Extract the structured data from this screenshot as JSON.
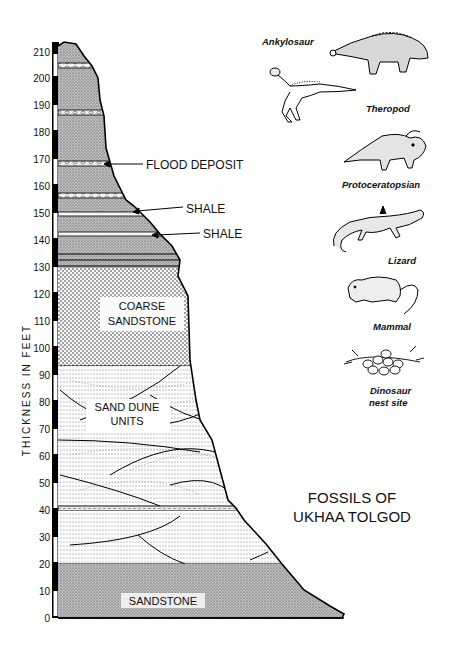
{
  "title": {
    "line1": "FOSSILS OF",
    "line2": "UKHAA TOLGOD"
  },
  "axis": {
    "label": "THICKNESS IN FEET",
    "ticks": [
      "0",
      "10",
      "20",
      "30",
      "40",
      "50",
      "60",
      "70",
      "80",
      "90",
      "100",
      "110",
      "120",
      "130",
      "140",
      "150",
      "160",
      "170",
      "180",
      "190",
      "200",
      "210"
    ]
  },
  "annotations": {
    "flood_deposit": "FLOOD DEPOSIT",
    "shale_upper": "SHALE",
    "shale_lower": "SHALE"
  },
  "units": {
    "coarse_sandstone": {
      "line1": "COARSE",
      "line2": "SANDSTONE"
    },
    "sand_dune": {
      "line1": "SAND DUNE",
      "line2": "UNITS"
    },
    "sandstone": "SANDSTONE"
  },
  "fossils": [
    {
      "name": "Ankylosaur",
      "icon": "ankylosaur-icon"
    },
    {
      "name": "Theropod",
      "icon": "theropod-icon"
    },
    {
      "name": "Protoceratopsian",
      "icon": "protoceratopsian-icon"
    },
    {
      "name": "Lizard",
      "icon": "lizard-icon"
    },
    {
      "name": "Mammal",
      "icon": "mammal-icon"
    },
    {
      "name": "Dinosaur",
      "name2": "nest site",
      "icon": "nest-icon"
    }
  ],
  "strata": [
    {
      "unit": "Sandstone",
      "from_ft": 0,
      "to_ft": 20
    },
    {
      "unit": "Sand dune units",
      "from_ft": 20,
      "to_ft": 40
    },
    {
      "unit": "Thin bed",
      "from_ft": 40,
      "to_ft": 42
    },
    {
      "unit": "Sand dune units",
      "from_ft": 42,
      "to_ft": 94
    },
    {
      "unit": "Coarse sandstone",
      "from_ft": 94,
      "to_ft": 130
    },
    {
      "unit": "Shale",
      "from_ft": 146,
      "to_ft": 148
    },
    {
      "unit": "Shale",
      "from_ft": 152,
      "to_ft": 154
    },
    {
      "unit": "Flood deposit",
      "from_ft": 169,
      "to_ft": 171
    }
  ]
}
